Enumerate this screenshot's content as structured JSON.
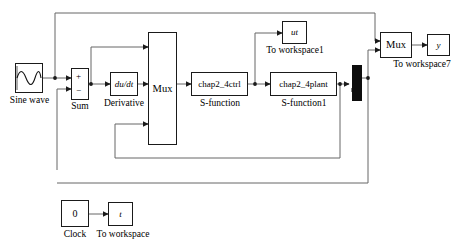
{
  "diagram": {
    "line_color": "#4d4d4d",
    "block_border_color": "#1a1a1a",
    "mux_fill_color": "#0d0d0d",
    "background": "#ffffff"
  },
  "blocks": {
    "sine_wave": {
      "label": "Sine wave",
      "icon": "sine-wave-icon",
      "text": ""
    },
    "sum": {
      "label": "Sum",
      "plus": "+",
      "minus": "−"
    },
    "derivative": {
      "label": "Derivative",
      "text": "du/dt"
    },
    "mux1": {
      "text": "Mux",
      "label": ""
    },
    "sfunction": {
      "text": "chap2_4ctrl",
      "label": "S-function"
    },
    "sfunction1": {
      "text": "chap2_4plant",
      "label": "S-function1"
    },
    "to_workspace1": {
      "text": "ut",
      "label": "To workspace1"
    },
    "mux_bus": {
      "text": "",
      "label": ""
    },
    "mux2": {
      "text": "Mux",
      "label": ""
    },
    "to_workspace7": {
      "text": "y",
      "label": "To workspace7"
    },
    "clock": {
      "text": "0",
      "label": "Clock"
    },
    "to_workspace": {
      "text": "t",
      "label": "To workspace"
    }
  }
}
